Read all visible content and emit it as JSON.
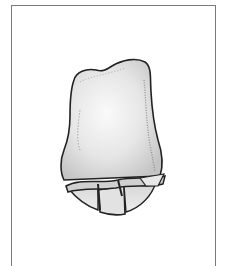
{
  "figure": {
    "caption": "",
    "colors": {
      "frame": "#7a7a7a",
      "outline": "#222222",
      "fill_light": "#f4f4f4",
      "fill_mid": "#dcdcdc",
      "fill_dark": "#b8b8b8",
      "stipple": "#8c8c8c",
      "background": "#ffffff"
    }
  }
}
